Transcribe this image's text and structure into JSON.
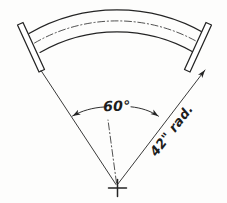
{
  "drawing": {
    "title": "curved-rod-radius-detail",
    "background_color": "#fdfdfc",
    "ink_color": "#242424",
    "labels": {
      "angle": "60°",
      "radius": "42\" rad."
    },
    "geometry": {
      "center_x": 117,
      "center_y": 186,
      "included_angle_deg": 60,
      "outer_radius_px": 176,
      "inner_radius_px": 154,
      "center_radius_px": 165,
      "angle_arc_radius_px": 80,
      "start_angle_deg": -120,
      "end_angle_deg": -60
    },
    "parts": [
      {
        "name": "outer-arc",
        "kind": "arc"
      },
      {
        "name": "centerline-arc",
        "kind": "dash-dot-arc"
      },
      {
        "name": "inner-arc",
        "kind": "arc"
      },
      {
        "name": "left-end-flange",
        "kind": "rectangle"
      },
      {
        "name": "right-end-flange",
        "kind": "rectangle"
      },
      {
        "name": "left-radius-line",
        "kind": "dimension-line"
      },
      {
        "name": "right-radius-line",
        "kind": "dimension-line"
      },
      {
        "name": "radius-centerline",
        "kind": "dash-dot-line"
      },
      {
        "name": "angle-dimension-arc",
        "kind": "double-arrow-arc"
      },
      {
        "name": "center-cross-mark",
        "kind": "cross"
      }
    ]
  }
}
